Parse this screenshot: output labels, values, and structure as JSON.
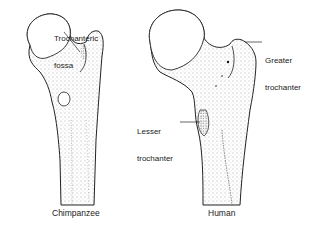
{
  "figure": {
    "specimens": [
      {
        "name": "Chimpanzee",
        "labels": [
          {
            "id": "trochanteric-fossa",
            "line1": "Trochanteric",
            "line2": "fossa"
          }
        ]
      },
      {
        "name": "Human",
        "labels": [
          {
            "id": "greater-trochanter",
            "line1": "Greater",
            "line2": "trochanter"
          },
          {
            "id": "lesser-trochanter",
            "line1": "Lesser",
            "line2": "trochanter"
          }
        ]
      }
    ],
    "colors": {
      "ink": "#222222",
      "stipple": "#555555",
      "background": "#ffffff"
    }
  }
}
